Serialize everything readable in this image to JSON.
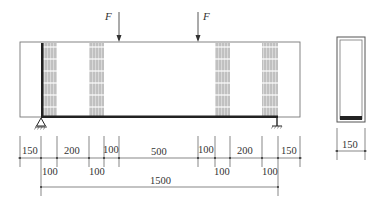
{
  "diagram": {
    "type": "beam-elevation-and-cross-section",
    "loads": [
      {
        "label": "F",
        "x": 119
      },
      {
        "label": "F",
        "x": 198
      }
    ],
    "beam": {
      "x1": 20,
      "x2": 300,
      "y_top": 42,
      "y_bottom": 117
    },
    "supports": [
      {
        "type": "pin",
        "x": 41
      },
      {
        "type": "pin",
        "x": 277
      }
    ],
    "strengthening_strips": [
      {
        "x1": 41,
        "x2": 57,
        "dark_edge": true
      },
      {
        "x1": 89,
        "x2": 104,
        "dark_edge": false
      },
      {
        "x1": 215,
        "x2": 230,
        "dark_edge": false
      },
      {
        "x1": 262,
        "x2": 278,
        "dark_edge": false
      }
    ],
    "colors": {
      "line": "#555555",
      "hatch": "#999999",
      "hatch_fill": "#d8d8d8",
      "plate": "#222222"
    }
  },
  "dimensions": {
    "top_row": [
      {
        "label": "150",
        "x": 31
      },
      {
        "label": "200",
        "x": 73
      },
      {
        "label": "100",
        "x": 111
      },
      {
        "label": "500",
        "x": 158
      },
      {
        "label": "100",
        "x": 206
      },
      {
        "label": "200",
        "x": 246
      },
      {
        "label": "150",
        "x": 289
      }
    ],
    "bottom_row": [
      {
        "label": "100",
        "x": 49
      },
      {
        "label": "100",
        "x": 96
      },
      {
        "label": "100",
        "x": 222
      },
      {
        "label": "100",
        "x": 270
      }
    ],
    "total": {
      "label": "1500",
      "x": 159
    },
    "tick_positions": [
      20,
      41,
      57,
      89,
      104,
      119,
      198,
      215,
      230,
      262,
      278,
      300
    ]
  },
  "cross_section": {
    "width_label": "150",
    "x1": 337,
    "x2": 365,
    "y_top": 37,
    "y_bottom": 122
  }
}
